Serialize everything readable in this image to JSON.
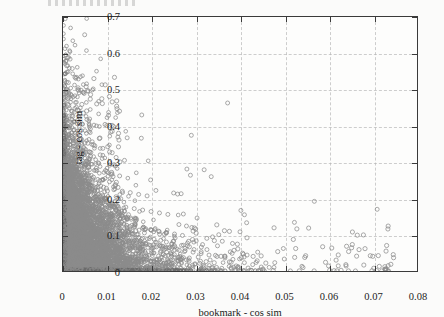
{
  "figure": {
    "kind": "scatter-plot",
    "background_color": "#fbfbfa",
    "plot_background_color": "#fdfdfc",
    "frame_color": "#3a3a3a",
    "grid_color": "#b4b4b4",
    "marker_color": "#8b8b8b",
    "cropped_caption_above": ""
  },
  "chart_data": {
    "type": "scatter",
    "title": "",
    "xlabel": "bookmark - cos sim",
    "ylabel": "tag - cos sim",
    "xlim": [
      0,
      0.08
    ],
    "ylim": [
      0,
      0.7
    ],
    "xticks": [
      0,
      0.01,
      0.02,
      0.03,
      0.04,
      0.05,
      0.06,
      0.07,
      0.08
    ],
    "xticklabels": [
      "0",
      "0.01",
      "0.02",
      "0.03",
      "0.04",
      "0.05",
      "0.06",
      "0.07",
      "0.08"
    ],
    "yticks": [
      0,
      0.1,
      0.2,
      0.3,
      0.4,
      0.5,
      0.6,
      0.7
    ],
    "yticklabels": [
      "0",
      "0.1",
      "0.2",
      "0.3",
      "0.4",
      "0.5",
      "0.6",
      "0.7"
    ],
    "grid": true,
    "grid_style": "dashed",
    "legend": null,
    "marker": "open-circle",
    "marker_color": "#8b8b8b",
    "points": [
      [
        0.0049,
        0.651
      ],
      [
        0.0006,
        0.578
      ],
      [
        0.0004,
        0.572
      ],
      [
        0.0016,
        0.584
      ],
      [
        0.0008,
        0.566
      ],
      [
        0.0021,
        0.558
      ],
      [
        0.0006,
        0.545
      ],
      [
        0.0027,
        0.534
      ],
      [
        0.0029,
        0.531
      ],
      [
        0.0004,
        0.522
      ],
      [
        0.0034,
        0.505
      ],
      [
        0.0041,
        0.498
      ],
      [
        0.0046,
        0.492
      ],
      [
        0.0003,
        0.486
      ],
      [
        0.0002,
        0.478
      ],
      [
        0.0005,
        0.47
      ],
      [
        0.0372,
        0.463
      ],
      [
        0.0002,
        0.455
      ],
      [
        0.0021,
        0.44
      ],
      [
        0.0103,
        0.429
      ],
      [
        0.0178,
        0.43
      ],
      [
        0.0004,
        0.424
      ],
      [
        0.0026,
        0.412
      ],
      [
        0.0003,
        0.405
      ],
      [
        0.0095,
        0.404
      ],
      [
        0.0099,
        0.401
      ],
      [
        0.0002,
        0.398
      ],
      [
        0.006,
        0.397
      ],
      [
        0.0062,
        0.392
      ],
      [
        0.0001,
        0.388
      ],
      [
        0.0108,
        0.383
      ],
      [
        0.0005,
        0.379
      ],
      [
        0.029,
        0.374
      ],
      [
        0.0124,
        0.369
      ],
      [
        0.0145,
        0.367
      ],
      [
        0.0177,
        0.366
      ],
      [
        0.0042,
        0.363
      ],
      [
        0.0028,
        0.358
      ],
      [
        0.0056,
        0.352
      ],
      [
        0.0069,
        0.348
      ],
      [
        0.0072,
        0.345
      ],
      [
        0.0037,
        0.34
      ],
      [
        0.009,
        0.338
      ],
      [
        0.0031,
        0.333
      ],
      [
        0.0045,
        0.33
      ],
      [
        0.0063,
        0.327
      ],
      [
        0.002,
        0.323
      ],
      [
        0.0084,
        0.32
      ],
      [
        0.0014,
        0.316
      ],
      [
        0.012,
        0.313
      ],
      [
        0.0139,
        0.305
      ],
      [
        0.0053,
        0.303
      ],
      [
        0.0009,
        0.3
      ],
      [
        0.028,
        0.281
      ],
      [
        0.0319,
        0.279
      ],
      [
        0.0022,
        0.296
      ],
      [
        0.004,
        0.29
      ],
      [
        0.0058,
        0.286
      ],
      [
        0.0075,
        0.283
      ],
      [
        0.0096,
        0.277
      ],
      [
        0.011,
        0.272
      ],
      [
        0.0288,
        0.264
      ],
      [
        0.0335,
        0.26
      ],
      [
        0.0128,
        0.262
      ],
      [
        0.0018,
        0.268
      ],
      [
        0.0035,
        0.265
      ],
      [
        0.005,
        0.258
      ],
      [
        0.0067,
        0.254
      ],
      [
        0.0088,
        0.25
      ],
      [
        0.0198,
        0.251
      ],
      [
        0.0105,
        0.246
      ],
      [
        0.0012,
        0.258
      ],
      [
        0.0026,
        0.252
      ],
      [
        0.021,
        0.222
      ],
      [
        0.025,
        0.215
      ],
      [
        0.0259,
        0.212
      ],
      [
        0.0267,
        0.213
      ],
      [
        0.0043,
        0.24
      ],
      [
        0.0061,
        0.236
      ],
      [
        0.0079,
        0.232
      ],
      [
        0.0098,
        0.228
      ],
      [
        0.0115,
        0.224
      ],
      [
        0.0134,
        0.22
      ],
      [
        0.0152,
        0.216
      ],
      [
        0.0171,
        0.211
      ],
      [
        0.019,
        0.207
      ],
      [
        0.0008,
        0.245
      ],
      [
        0.0016,
        0.238
      ],
      [
        0.0024,
        0.232
      ],
      [
        0.0568,
        0.192
      ],
      [
        0.071,
        0.17
      ],
      [
        0.0402,
        0.167
      ],
      [
        0.041,
        0.155
      ],
      [
        0.0272,
        0.157
      ],
      [
        0.0303,
        0.146
      ],
      [
        0.0523,
        0.134
      ],
      [
        0.0415,
        0.133
      ],
      [
        0.003,
        0.2
      ],
      [
        0.0048,
        0.196
      ],
      [
        0.0066,
        0.192
      ],
      [
        0.0085,
        0.188
      ],
      [
        0.0104,
        0.184
      ],
      [
        0.0123,
        0.18
      ],
      [
        0.0142,
        0.176
      ],
      [
        0.0161,
        0.172
      ],
      [
        0.018,
        0.168
      ],
      [
        0.0199,
        0.164
      ],
      [
        0.0218,
        0.16
      ],
      [
        0.0237,
        0.156
      ],
      [
        0.001,
        0.205
      ],
      [
        0.002,
        0.198
      ],
      [
        0.0291,
        0.12
      ],
      [
        0.03,
        0.116
      ],
      [
        0.0279,
        0.124
      ],
      [
        0.0262,
        0.128
      ],
      [
        0.04,
        0.108
      ],
      [
        0.0352,
        0.1
      ],
      [
        0.0338,
        0.094
      ],
      [
        0.0325,
        0.09
      ],
      [
        0.036,
        0.082
      ],
      [
        0.0383,
        0.076
      ],
      [
        0.0498,
        0.062
      ],
      [
        0.05,
        0.033
      ],
      [
        0.044,
        0.052
      ],
      [
        0.0416,
        0.044
      ],
      [
        0.0036,
        0.15
      ],
      [
        0.0054,
        0.146
      ],
      [
        0.0072,
        0.142
      ],
      [
        0.009,
        0.138
      ],
      [
        0.0108,
        0.134
      ],
      [
        0.0126,
        0.13
      ],
      [
        0.0144,
        0.126
      ],
      [
        0.0162,
        0.122
      ],
      [
        0.018,
        0.118
      ],
      [
        0.0198,
        0.114
      ],
      [
        0.0216,
        0.11
      ],
      [
        0.0234,
        0.106
      ],
      [
        0.0252,
        0.102
      ],
      [
        0.027,
        0.098
      ],
      [
        0.06,
        0.014
      ],
      [
        0.054,
        0.013
      ],
      [
        0.0735,
        0.015
      ],
      [
        0.0448,
        0.011
      ],
      [
        0.0466,
        0.01
      ],
      [
        0.038,
        0.009
      ],
      [
        0.0042,
        0.108
      ],
      [
        0.006,
        0.104
      ],
      [
        0.0078,
        0.1
      ],
      [
        0.0096,
        0.096
      ],
      [
        0.0114,
        0.092
      ],
      [
        0.0132,
        0.088
      ],
      [
        0.015,
        0.084
      ],
      [
        0.0168,
        0.08
      ],
      [
        0.0186,
        0.076
      ],
      [
        0.0204,
        0.072
      ],
      [
        0.0222,
        0.068
      ],
      [
        0.024,
        0.064
      ],
      [
        0.0258,
        0.06
      ],
      [
        0.0276,
        0.056
      ],
      [
        0.0294,
        0.052
      ],
      [
        0.0312,
        0.048
      ],
      [
        0.033,
        0.044
      ],
      [
        0.0348,
        0.04
      ],
      [
        0.0366,
        0.036
      ],
      [
        0.0384,
        0.032
      ]
    ]
  }
}
